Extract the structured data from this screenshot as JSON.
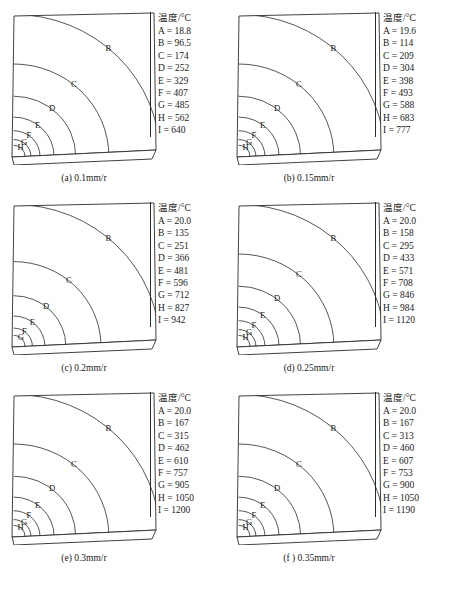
{
  "figure": {
    "legend_title": "温度/°C",
    "contour_keys": [
      "A",
      "B",
      "C",
      "D",
      "E",
      "F",
      "G",
      "H",
      "I"
    ],
    "axis_note": "",
    "line_color": "#2b2b2b",
    "background_color": "#ffffff"
  },
  "panels": [
    {
      "id": "a",
      "caption": "(a) 0.1mm/r",
      "feed_rate": "0.1mm/r",
      "legend_title": "温度/°C",
      "visible_contour_labels": [
        "B",
        "C",
        "D",
        "E",
        "F",
        "G",
        "H"
      ],
      "entries": [
        {
          "key": "A",
          "value": "18.8",
          "text": "A = 18.8"
        },
        {
          "key": "B",
          "value": "96.5",
          "text": "B = 96.5"
        },
        {
          "key": "C",
          "value": "174",
          "text": "C = 174"
        },
        {
          "key": "D",
          "value": "252",
          "text": "D = 252"
        },
        {
          "key": "E",
          "value": "329",
          "text": "E = 329"
        },
        {
          "key": "F",
          "value": "407",
          "text": "F = 407"
        },
        {
          "key": "G",
          "value": "485",
          "text": "G = 485"
        },
        {
          "key": "H",
          "value": "562",
          "text": "H = 562"
        },
        {
          "key": "I",
          "value": "640",
          "text": "I = 640"
        }
      ]
    },
    {
      "id": "b",
      "caption": "(b) 0.15mm/r",
      "feed_rate": "0.15mm/r",
      "legend_title": "温度/°C",
      "visible_contour_labels": [
        "B",
        "C",
        "D",
        "E",
        "F",
        "G",
        "H"
      ],
      "entries": [
        {
          "key": "A",
          "value": "19.6",
          "text": "A = 19.6"
        },
        {
          "key": "B",
          "value": "114",
          "text": "B = 114"
        },
        {
          "key": "C",
          "value": "209",
          "text": "C = 209"
        },
        {
          "key": "D",
          "value": "304",
          "text": "D = 304"
        },
        {
          "key": "E",
          "value": "398",
          "text": "E = 398"
        },
        {
          "key": "F",
          "value": "493",
          "text": "F = 493"
        },
        {
          "key": "G",
          "value": "588",
          "text": "G = 588"
        },
        {
          "key": "H",
          "value": "683",
          "text": "H = 683"
        },
        {
          "key": "I",
          "value": "777",
          "text": "I = 777"
        }
      ]
    },
    {
      "id": "c",
      "caption": "(c) 0.2mm/r",
      "feed_rate": "0.2mm/r",
      "legend_title": "温度/°C",
      "visible_contour_labels": [
        "B",
        "C",
        "D",
        "E",
        "F",
        "G"
      ],
      "entries": [
        {
          "key": "A",
          "value": "20.0",
          "text": "A = 20.0"
        },
        {
          "key": "B",
          "value": "135",
          "text": "B = 135"
        },
        {
          "key": "C",
          "value": "251",
          "text": "C = 251"
        },
        {
          "key": "D",
          "value": "366",
          "text": "D = 366"
        },
        {
          "key": "E",
          "value": "481",
          "text": "E = 481"
        },
        {
          "key": "F",
          "value": "596",
          "text": "F = 596"
        },
        {
          "key": "G",
          "value": "712",
          "text": "G = 712"
        },
        {
          "key": "H",
          "value": "827",
          "text": "H = 827"
        },
        {
          "key": "I",
          "value": "942",
          "text": "I = 942"
        }
      ]
    },
    {
      "id": "d",
      "caption": "(d) 0.25mm/r",
      "feed_rate": "0.25mm/r",
      "legend_title": "温度/°C",
      "visible_contour_labels": [
        "B",
        "C",
        "D",
        "E",
        "F",
        "G",
        "H"
      ],
      "entries": [
        {
          "key": "A",
          "value": "20.0",
          "text": "A = 20.0"
        },
        {
          "key": "B",
          "value": "158",
          "text": "B = 158"
        },
        {
          "key": "C",
          "value": "295",
          "text": "C = 295"
        },
        {
          "key": "D",
          "value": "433",
          "text": "D = 433"
        },
        {
          "key": "E",
          "value": "571",
          "text": "E = 571"
        },
        {
          "key": "F",
          "value": "708",
          "text": "F = 708"
        },
        {
          "key": "G",
          "value": "846",
          "text": "G = 846"
        },
        {
          "key": "H",
          "value": "984",
          "text": "H = 984"
        },
        {
          "key": "I",
          "value": "1120",
          "text": "I = 1120"
        }
      ]
    },
    {
      "id": "e",
      "caption": "(e) 0.3mm/r",
      "feed_rate": "0.3mm/r",
      "legend_title": "温度/°C",
      "visible_contour_labels": [
        "B",
        "C",
        "D",
        "E",
        "F",
        "G",
        "H"
      ],
      "entries": [
        {
          "key": "A",
          "value": "20.0",
          "text": "A = 20.0"
        },
        {
          "key": "B",
          "value": "167",
          "text": "B = 167"
        },
        {
          "key": "C",
          "value": "315",
          "text": "C = 315"
        },
        {
          "key": "D",
          "value": "462",
          "text": "D = 462"
        },
        {
          "key": "E",
          "value": "610",
          "text": "E = 610"
        },
        {
          "key": "F",
          "value": "757",
          "text": "F = 757"
        },
        {
          "key": "G",
          "value": "905",
          "text": "G = 905"
        },
        {
          "key": "H",
          "value": "1050",
          "text": "H = 1050"
        },
        {
          "key": "I",
          "value": "1200",
          "text": "I = 1200"
        }
      ]
    },
    {
      "id": "f",
      "caption": "(f ) 0.35mm/r",
      "feed_rate": "0.35mm/r",
      "legend_title": "温度/°C",
      "visible_contour_labels": [
        "B",
        "C",
        "D",
        "E",
        "F",
        "G",
        "H"
      ],
      "entries": [
        {
          "key": "A",
          "value": "20.0",
          "text": "A = 20.0"
        },
        {
          "key": "B",
          "value": "167",
          "text": "B = 167"
        },
        {
          "key": "C",
          "value": "313",
          "text": "C = 313"
        },
        {
          "key": "D",
          "value": "460",
          "text": "D = 460"
        },
        {
          "key": "E",
          "value": "607",
          "text": "E = 607"
        },
        {
          "key": "F",
          "value": "753",
          "text": "F = 753"
        },
        {
          "key": "G",
          "value": "900",
          "text": "G = 900"
        },
        {
          "key": "H",
          "value": "1050",
          "text": "H = 1050"
        },
        {
          "key": "I",
          "value": "1190",
          "text": "I = 1190"
        }
      ]
    }
  ],
  "chart_data": {
    "type": "heatmap",
    "title": "",
    "subtitle": "",
    "xlabel": "",
    "ylabel": "",
    "legend_position": "right",
    "grid": false,
    "units": "°C",
    "level_keys": [
      "A",
      "B",
      "C",
      "D",
      "E",
      "F",
      "G",
      "H",
      "I"
    ],
    "series": [
      {
        "name": "(a) 0.1mm/r",
        "values": [
          18.8,
          96.5,
          174,
          252,
          329,
          407,
          485,
          562,
          640
        ]
      },
      {
        "name": "(b) 0.15mm/r",
        "values": [
          19.6,
          114,
          209,
          304,
          398,
          493,
          588,
          683,
          777
        ]
      },
      {
        "name": "(c) 0.2mm/r",
        "values": [
          20.0,
          135,
          251,
          366,
          481,
          596,
          712,
          827,
          942
        ]
      },
      {
        "name": "(d) 0.25mm/r",
        "values": [
          20.0,
          158,
          295,
          433,
          571,
          708,
          846,
          984,
          1120
        ]
      },
      {
        "name": "(e) 0.3mm/r",
        "values": [
          20.0,
          167,
          315,
          462,
          610,
          757,
          905,
          1050,
          1200
        ]
      },
      {
        "name": "(f ) 0.35mm/r",
        "values": [
          20.0,
          167,
          313,
          460,
          607,
          753,
          900,
          1050,
          1190
        ]
      }
    ]
  }
}
